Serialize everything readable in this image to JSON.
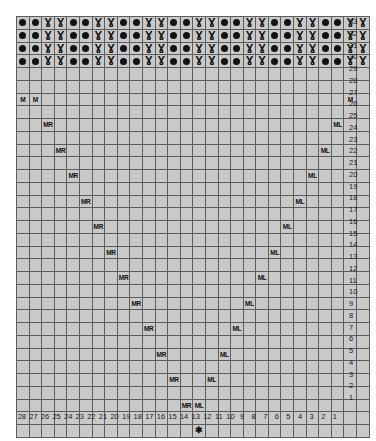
{
  "chart": {
    "columns": 28,
    "rows": 33,
    "column_labels": [
      28,
      27,
      26,
      25,
      24,
      23,
      22,
      21,
      20,
      19,
      18,
      17,
      16,
      15,
      14,
      13,
      12,
      11,
      10,
      9,
      8,
      7,
      6,
      5,
      4,
      3,
      2,
      1
    ],
    "row_labels": [
      33,
      32,
      31,
      30,
      29,
      28,
      27,
      26,
      25,
      24,
      23,
      22,
      21,
      20,
      19,
      18,
      17,
      16,
      15,
      14,
      13,
      12,
      11,
      10,
      9,
      8,
      7,
      6,
      5,
      4,
      3,
      2,
      1
    ],
    "symbols": {
      "purl": "●",
      "twist": "Ɣ",
      "star": "✱",
      "make_right": "MR",
      "make_left": "ML",
      "make": "M"
    },
    "colors": {
      "cell_light": "#f1f1f1",
      "cell_mid": "#c9c9c9",
      "cell_dark": "#a8a8a8",
      "cell_symbol": "#bdbdbd",
      "cell_star": "#8f8f8f",
      "grid_line": "#5d5d5d",
      "grid_line_heavy": "#3a3a3a",
      "text": "#101010",
      "page_background": "#ffffff"
    },
    "notes": {
      "rib_rows": [
        33,
        32,
        31,
        30
      ],
      "rib_repeat": [
        "purl",
        "purl",
        "twist",
        "twist"
      ],
      "star_row": 1,
      "star_column": 14,
      "increase_rows": [
        3,
        5,
        7,
        9,
        11,
        13,
        15,
        17,
        19,
        21,
        23,
        25,
        27
      ],
      "make_row": 27
    },
    "cells": [
      {
        "row": 33,
        "marks": [
          {
            "col": 28,
            "sym": "purl"
          },
          {
            "col": 27,
            "sym": "purl"
          },
          {
            "col": 26,
            "sym": "twist"
          },
          {
            "col": 25,
            "sym": "twist"
          },
          {
            "col": 24,
            "sym": "purl"
          },
          {
            "col": 23,
            "sym": "purl"
          },
          {
            "col": 22,
            "sym": "twist"
          },
          {
            "col": 21,
            "sym": "twist"
          },
          {
            "col": 20,
            "sym": "purl"
          },
          {
            "col": 19,
            "sym": "purl"
          },
          {
            "col": 18,
            "sym": "twist"
          },
          {
            "col": 17,
            "sym": "twist"
          },
          {
            "col": 16,
            "sym": "purl"
          },
          {
            "col": 15,
            "sym": "purl"
          },
          {
            "col": 14,
            "sym": "twist"
          },
          {
            "col": 13,
            "sym": "twist"
          },
          {
            "col": 12,
            "sym": "purl"
          },
          {
            "col": 11,
            "sym": "purl"
          },
          {
            "col": 10,
            "sym": "twist"
          },
          {
            "col": 9,
            "sym": "twist"
          },
          {
            "col": 8,
            "sym": "purl"
          },
          {
            "col": 7,
            "sym": "purl"
          },
          {
            "col": 6,
            "sym": "twist"
          },
          {
            "col": 5,
            "sym": "twist"
          },
          {
            "col": 4,
            "sym": "purl"
          },
          {
            "col": 3,
            "sym": "purl"
          },
          {
            "col": 2,
            "sym": "twist"
          },
          {
            "col": 1,
            "sym": "twist"
          }
        ]
      },
      {
        "row": 32,
        "marks": [
          {
            "col": 28,
            "sym": "purl"
          },
          {
            "col": 27,
            "sym": "purl"
          },
          {
            "col": 26,
            "sym": "twist"
          },
          {
            "col": 25,
            "sym": "twist"
          },
          {
            "col": 24,
            "sym": "purl"
          },
          {
            "col": 23,
            "sym": "purl"
          },
          {
            "col": 22,
            "sym": "twist"
          },
          {
            "col": 21,
            "sym": "twist"
          },
          {
            "col": 20,
            "sym": "purl"
          },
          {
            "col": 19,
            "sym": "purl"
          },
          {
            "col": 18,
            "sym": "twist"
          },
          {
            "col": 17,
            "sym": "twist"
          },
          {
            "col": 16,
            "sym": "purl"
          },
          {
            "col": 15,
            "sym": "purl"
          },
          {
            "col": 14,
            "sym": "twist"
          },
          {
            "col": 13,
            "sym": "twist"
          },
          {
            "col": 12,
            "sym": "purl"
          },
          {
            "col": 11,
            "sym": "purl"
          },
          {
            "col": 10,
            "sym": "twist"
          },
          {
            "col": 9,
            "sym": "twist"
          },
          {
            "col": 8,
            "sym": "purl"
          },
          {
            "col": 7,
            "sym": "purl"
          },
          {
            "col": 6,
            "sym": "twist"
          },
          {
            "col": 5,
            "sym": "twist"
          },
          {
            "col": 4,
            "sym": "purl"
          },
          {
            "col": 3,
            "sym": "purl"
          },
          {
            "col": 2,
            "sym": "twist"
          },
          {
            "col": 1,
            "sym": "twist"
          }
        ]
      },
      {
        "row": 31,
        "marks": [
          {
            "col": 28,
            "sym": "purl"
          },
          {
            "col": 27,
            "sym": "purl"
          },
          {
            "col": 26,
            "sym": "twist"
          },
          {
            "col": 25,
            "sym": "twist"
          },
          {
            "col": 24,
            "sym": "purl"
          },
          {
            "col": 23,
            "sym": "purl"
          },
          {
            "col": 22,
            "sym": "twist"
          },
          {
            "col": 21,
            "sym": "twist"
          },
          {
            "col": 20,
            "sym": "purl"
          },
          {
            "col": 19,
            "sym": "purl"
          },
          {
            "col": 18,
            "sym": "twist"
          },
          {
            "col": 17,
            "sym": "twist"
          },
          {
            "col": 16,
            "sym": "purl"
          },
          {
            "col": 15,
            "sym": "purl"
          },
          {
            "col": 14,
            "sym": "twist"
          },
          {
            "col": 13,
            "sym": "twist"
          },
          {
            "col": 12,
            "sym": "purl"
          },
          {
            "col": 11,
            "sym": "purl"
          },
          {
            "col": 10,
            "sym": "twist"
          },
          {
            "col": 9,
            "sym": "twist"
          },
          {
            "col": 8,
            "sym": "purl"
          },
          {
            "col": 7,
            "sym": "purl"
          },
          {
            "col": 6,
            "sym": "twist"
          },
          {
            "col": 5,
            "sym": "twist"
          },
          {
            "col": 4,
            "sym": "purl"
          },
          {
            "col": 3,
            "sym": "purl"
          },
          {
            "col": 2,
            "sym": "twist"
          },
          {
            "col": 1,
            "sym": "twist"
          }
        ]
      },
      {
        "row": 30,
        "marks": [
          {
            "col": 28,
            "sym": "purl"
          },
          {
            "col": 27,
            "sym": "purl"
          },
          {
            "col": 26,
            "sym": "twist"
          },
          {
            "col": 25,
            "sym": "twist"
          },
          {
            "col": 24,
            "sym": "purl"
          },
          {
            "col": 23,
            "sym": "purl"
          },
          {
            "col": 22,
            "sym": "twist"
          },
          {
            "col": 21,
            "sym": "twist"
          },
          {
            "col": 20,
            "sym": "purl"
          },
          {
            "col": 19,
            "sym": "purl"
          },
          {
            "col": 18,
            "sym": "twist"
          },
          {
            "col": 17,
            "sym": "twist"
          },
          {
            "col": 16,
            "sym": "purl"
          },
          {
            "col": 15,
            "sym": "purl"
          },
          {
            "col": 14,
            "sym": "twist"
          },
          {
            "col": 13,
            "sym": "twist"
          },
          {
            "col": 12,
            "sym": "purl"
          },
          {
            "col": 11,
            "sym": "purl"
          },
          {
            "col": 10,
            "sym": "twist"
          },
          {
            "col": 9,
            "sym": "twist"
          },
          {
            "col": 8,
            "sym": "purl"
          },
          {
            "col": 7,
            "sym": "purl"
          },
          {
            "col": 6,
            "sym": "twist"
          },
          {
            "col": 5,
            "sym": "twist"
          },
          {
            "col": 4,
            "sym": "purl"
          },
          {
            "col": 3,
            "sym": "purl"
          },
          {
            "col": 2,
            "sym": "twist"
          },
          {
            "col": 1,
            "sym": "twist"
          }
        ]
      },
      {
        "row": 29,
        "marks": []
      },
      {
        "row": 28,
        "marks": []
      },
      {
        "row": 27,
        "marks": [
          {
            "col": 28,
            "sym": "make"
          },
          {
            "col": 27,
            "sym": "make"
          },
          {
            "col": 2,
            "sym": "make"
          }
        ]
      },
      {
        "row": 26,
        "marks": []
      },
      {
        "row": 25,
        "marks": [
          {
            "col": 26,
            "sym": "make_right"
          },
          {
            "col": 3,
            "sym": "make_left"
          }
        ]
      },
      {
        "row": 24,
        "marks": []
      },
      {
        "row": 23,
        "marks": [
          {
            "col": 25,
            "sym": "make_right"
          },
          {
            "col": 4,
            "sym": "make_left"
          }
        ]
      },
      {
        "row": 22,
        "marks": []
      },
      {
        "row": 21,
        "marks": [
          {
            "col": 24,
            "sym": "make_right"
          },
          {
            "col": 5,
            "sym": "make_left"
          }
        ]
      },
      {
        "row": 20,
        "marks": []
      },
      {
        "row": 19,
        "marks": [
          {
            "col": 23,
            "sym": "make_right"
          },
          {
            "col": 6,
            "sym": "make_left"
          }
        ]
      },
      {
        "row": 18,
        "marks": []
      },
      {
        "row": 17,
        "marks": [
          {
            "col": 22,
            "sym": "make_right"
          },
          {
            "col": 7,
            "sym": "make_left"
          }
        ]
      },
      {
        "row": 16,
        "marks": []
      },
      {
        "row": 15,
        "marks": [
          {
            "col": 21,
            "sym": "make_right"
          },
          {
            "col": 8,
            "sym": "make_left"
          }
        ]
      },
      {
        "row": 14,
        "marks": []
      },
      {
        "row": 13,
        "marks": [
          {
            "col": 20,
            "sym": "make_right"
          },
          {
            "col": 9,
            "sym": "make_left"
          }
        ]
      },
      {
        "row": 12,
        "marks": []
      },
      {
        "row": 11,
        "marks": [
          {
            "col": 19,
            "sym": "make_right"
          },
          {
            "col": 10,
            "sym": "make_left"
          }
        ]
      },
      {
        "row": 10,
        "marks": []
      },
      {
        "row": 9,
        "marks": [
          {
            "col": 18,
            "sym": "make_right"
          },
          {
            "col": 11,
            "sym": "make_left"
          }
        ]
      },
      {
        "row": 8,
        "marks": []
      },
      {
        "row": 7,
        "marks": [
          {
            "col": 17,
            "sym": "make_right"
          },
          {
            "col": 12,
            "sym": "make_left"
          }
        ]
      },
      {
        "row": 6,
        "marks": []
      },
      {
        "row": 5,
        "marks": [
          {
            "col": 16,
            "sym": "make_right"
          },
          {
            "col": 13,
            "sym": "make_left"
          }
        ]
      },
      {
        "row": 4,
        "marks": []
      },
      {
        "row": 3,
        "marks": [
          {
            "col": 15,
            "sym": "make_right"
          },
          {
            "col": 14,
            "sym": "make_left"
          }
        ]
      },
      {
        "row": 2,
        "marks": []
      },
      {
        "row": 1,
        "marks": [
          {
            "col": 14,
            "sym": "star"
          }
        ]
      }
    ],
    "gusset": [
      {
        "row": 29,
        "left": 28,
        "right": 1,
        "fill": "none"
      },
      {
        "row": 28,
        "left": 28,
        "right": 1,
        "fill": "none"
      },
      {
        "row": 27,
        "left": 26,
        "right": 3,
        "fill": "light"
      },
      {
        "row": 26,
        "left": 26,
        "right": 3,
        "fill": "light"
      },
      {
        "row": 25,
        "left": 25,
        "right": 4,
        "fill": "light"
      },
      {
        "row": 24,
        "left": 25,
        "right": 4,
        "fill": "light"
      },
      {
        "row": 23,
        "left": 24,
        "right": 5,
        "fill": "light"
      },
      {
        "row": 22,
        "left": 24,
        "right": 5,
        "fill": "light"
      },
      {
        "row": 21,
        "left": 23,
        "right": 6,
        "fill": "light"
      },
      {
        "row": 20,
        "left": 23,
        "right": 6,
        "fill": "light"
      },
      {
        "row": 19,
        "left": 22,
        "right": 7,
        "fill": "light"
      },
      {
        "row": 18,
        "left": 22,
        "right": 7,
        "fill": "light"
      },
      {
        "row": 17,
        "left": 21,
        "right": 8,
        "fill": "light"
      },
      {
        "row": 16,
        "left": 21,
        "right": 8,
        "fill": "light"
      },
      {
        "row": 15,
        "left": 20,
        "right": 9,
        "fill": "light"
      },
      {
        "row": 14,
        "left": 20,
        "right": 9,
        "fill": "light"
      },
      {
        "row": 13,
        "left": 19,
        "right": 10,
        "fill": "light"
      },
      {
        "row": 12,
        "left": 19,
        "right": 10,
        "fill": "light"
      },
      {
        "row": 11,
        "left": 18,
        "right": 11,
        "fill": "light"
      },
      {
        "row": 10,
        "left": 18,
        "right": 11,
        "fill": "light"
      },
      {
        "row": 9,
        "left": 17,
        "right": 12,
        "fill": "light"
      },
      {
        "row": 8,
        "left": 17,
        "right": 12,
        "fill": "light"
      },
      {
        "row": 7,
        "left": 16,
        "right": 13,
        "fill": "light"
      },
      {
        "row": 6,
        "left": 16,
        "right": 13,
        "fill": "light"
      },
      {
        "row": 5,
        "left": 15,
        "right": 14,
        "fill": "light"
      },
      {
        "row": 4,
        "left": 15,
        "right": 14,
        "fill": "light"
      },
      {
        "row": 3,
        "left": 14,
        "right": 14,
        "fill": "light"
      },
      {
        "row": 2,
        "left": 14,
        "right": 14,
        "fill": "light"
      },
      {
        "row": 1,
        "left": 0,
        "right": 0,
        "fill": "none"
      }
    ],
    "dark_band": [
      {
        "row": 21,
        "left": 23,
        "right": 6
      },
      {
        "row": 20,
        "left": 23,
        "right": 6
      },
      {
        "row": 19,
        "left": 22,
        "right": 7
      },
      {
        "row": 18,
        "left": 22,
        "right": 7
      },
      {
        "row": 23,
        "left": 24,
        "right": 5
      },
      {
        "row": 22,
        "left": 24,
        "right": 5
      }
    ]
  }
}
